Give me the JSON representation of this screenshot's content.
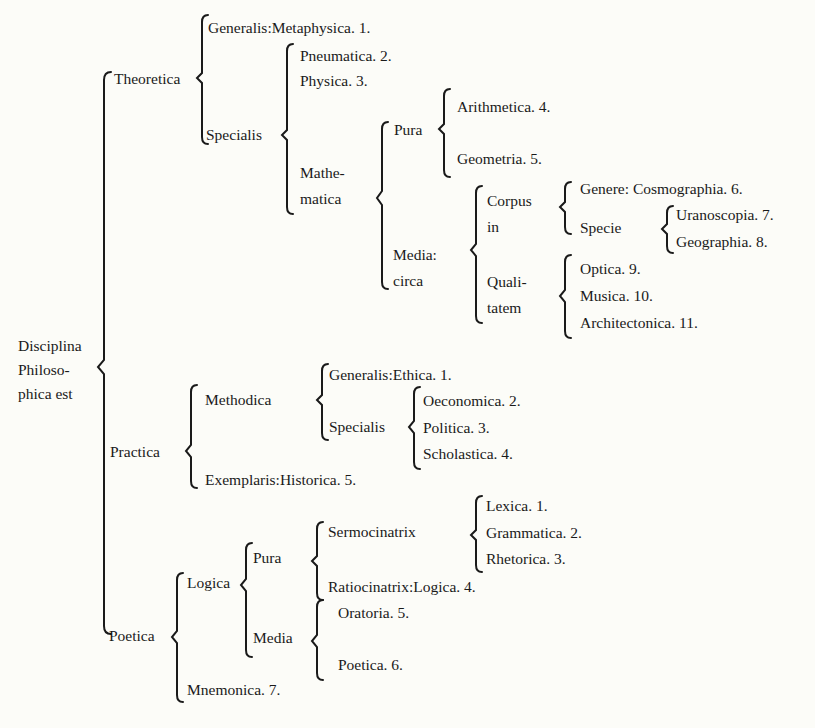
{
  "root": {
    "lines": [
      "Disciplina",
      "Philoso-",
      "phica est"
    ]
  },
  "theoretica": {
    "label": "Theoretica",
    "generalis": "Generalis:Metaphysica. 1.",
    "specialis": {
      "label": "Specialis",
      "pneumatica": "Pneumatica. 2.",
      "physica": "Physica. 3.",
      "mathematica": {
        "lines": [
          "Mathe-",
          "matica"
        ],
        "pura": {
          "label": "Pura",
          "items": [
            "Arithmetica. 4.",
            "Geometria. 5."
          ]
        },
        "media": {
          "lines": [
            "Media:",
            "circa"
          ],
          "corpus": {
            "lines": [
              "Corpus",
              "in"
            ],
            "genere": "Genere: Cosmographia. 6.",
            "specie": {
              "label": "Specie",
              "items": [
                "Uranoscopia. 7.",
                "Geographia. 8."
              ]
            }
          },
          "qualitatem": {
            "lines": [
              "Quali-",
              "tatem"
            ],
            "items": [
              "Optica. 9.",
              "Musica. 10.",
              "Architectonica. 11."
            ]
          }
        }
      }
    }
  },
  "practica": {
    "label": "Practica",
    "methodica": {
      "label": "Methodica",
      "generalis": "Generalis:Ethica. 1.",
      "specialis": {
        "label": "Specialis",
        "items": [
          "Oeconomica. 2.",
          "Politica. 3.",
          "Scholastica. 4."
        ]
      }
    },
    "exemplaris": "Exemplaris:Historica. 5."
  },
  "poetica": {
    "label": "Poetica",
    "logica": {
      "label": "Logica",
      "pura": {
        "label": "Pura",
        "sermocinatrix": {
          "label": "Sermocinatrix",
          "items": [
            "Lexica. 1.",
            "Grammatica. 2.",
            "Rhetorica. 3."
          ]
        },
        "ratiocinatrix": "Ratiocinatrix:Logica. 4."
      },
      "media": {
        "label": "Media",
        "items": [
          "Oratoria. 5.",
          "Poetica. 6."
        ]
      }
    },
    "mnemonica": "Mnemonica. 7."
  }
}
